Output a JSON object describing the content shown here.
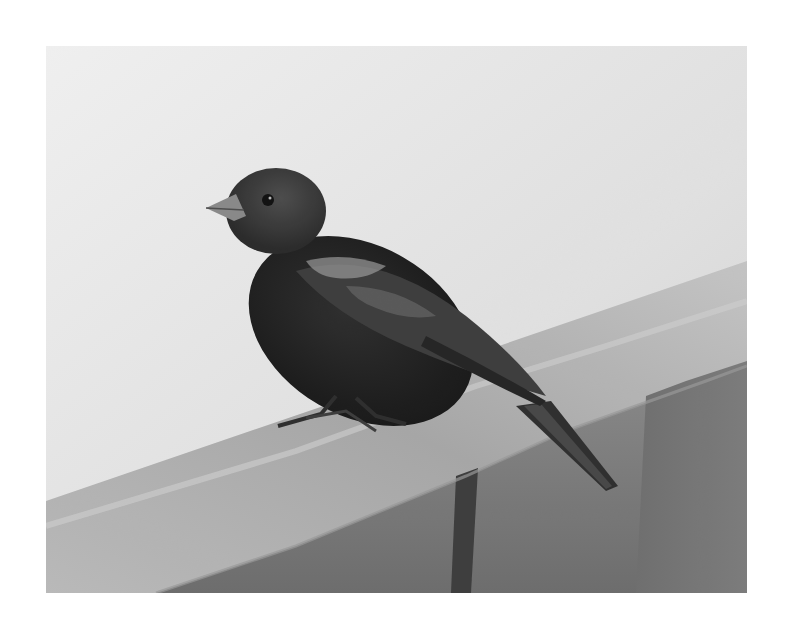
{
  "image": {
    "subject": "Bird perched on a wooden railing",
    "style": "grayscale photograph",
    "alt": "A dark songbird with a short conical beak perched on the corner of a wooden deck railing against a pale sky",
    "colors": {
      "page_background": "#ffffff",
      "sky_light": "#f2f2f2",
      "sky_mid": "#dcdcdc",
      "rail_top_light": "#c4c4c4",
      "rail_top_mid": "#a8a8a8",
      "rail_face": "#7a7a7a",
      "rail_face_dark": "#636363",
      "shadow_strip": "#3a3a3a",
      "bird_body": "#1e1e1e",
      "bird_head": "#3a3a3a",
      "wing_highlight": "#9a9a9a",
      "beak": "#8a8a8a"
    }
  }
}
